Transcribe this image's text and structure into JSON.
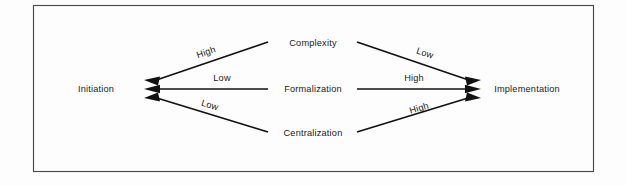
{
  "figure": {
    "background_color": "#fdfdfd",
    "frame": {
      "x": 33,
      "y": 5,
      "width": 561,
      "height": 167,
      "stroke_color": "#4a4a4a"
    }
  },
  "nodes": {
    "left": {
      "id": "initiation",
      "label": "Initiation",
      "x": 96,
      "y": 91
    },
    "right": {
      "id": "implementation",
      "label": "Implementation",
      "x": 527,
      "y": 91
    },
    "center": [
      {
        "id": "complexity",
        "label": "Complexity",
        "x": 313,
        "y": 46
      },
      {
        "id": "formalization",
        "label": "Formalization",
        "x": 313,
        "y": 91
      },
      {
        "id": "centralization",
        "label": "Centralization",
        "x": 313,
        "y": 136
      }
    ]
  },
  "edges": [
    {
      "id": "complexity-to-initiation",
      "from": "complexity",
      "to": "initiation",
      "label": "High",
      "label_x": 207,
      "label_y": 54,
      "label_rotation": -19,
      "x1": 268,
      "y1": 42,
      "x2": 150,
      "y2": 82
    },
    {
      "id": "complexity-to-implementation",
      "from": "complexity",
      "to": "implementation",
      "label": "Low",
      "label_x": 424,
      "label_y": 55,
      "label_rotation": 19,
      "x1": 357,
      "y1": 42,
      "x2": 475,
      "y2": 82
    },
    {
      "id": "formalization-to-initiation",
      "from": "formalization",
      "to": "initiation",
      "label": "Low",
      "label_x": 222,
      "label_y": 79,
      "label_rotation": 0,
      "x1": 268,
      "y1": 89,
      "x2": 150,
      "y2": 89
    },
    {
      "id": "formalization-to-implementation",
      "from": "formalization",
      "to": "implementation",
      "label": "High",
      "label_x": 414,
      "label_y": 79,
      "label_rotation": 0,
      "x1": 357,
      "y1": 89,
      "x2": 475,
      "y2": 89
    },
    {
      "id": "centralization-to-initiation",
      "from": "centralization",
      "to": "initiation",
      "label": "Low",
      "label_x": 209,
      "label_y": 106,
      "label_rotation": 19,
      "x1": 268,
      "y1": 132,
      "x2": 150,
      "y2": 96,
      "_note": "descending left to right reversed"
    },
    {
      "id": "centralization-to-implementation",
      "from": "centralization",
      "to": "implementation",
      "label": "High",
      "label_x": 420,
      "label_y": 110,
      "label_rotation": -19,
      "x1": 357,
      "y1": 132,
      "x2": 475,
      "y2": 96
    }
  ],
  "arrowheads": {
    "left_tip_x": 144,
    "right_tip_x": 481,
    "color": "#111111"
  }
}
